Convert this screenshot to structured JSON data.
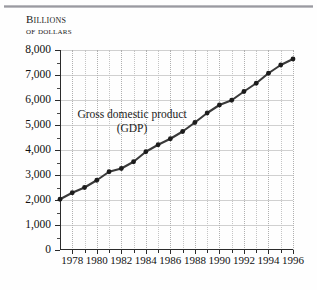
{
  "figure": {
    "background_color": "#fefefe",
    "rule_color": "#9a9aa0",
    "axis_color": "#2b2b2b",
    "series_color": "#3a3a3a",
    "marker_color": "#1c1c1c",
    "grid_color": "#d0d0d0"
  },
  "unit_caption": {
    "line1": "Billions",
    "line2": "of dollars"
  },
  "annotation": {
    "line1": "Gross domestic product",
    "line2": "(GDP)"
  },
  "chart_data": {
    "type": "line",
    "title": "",
    "subtitle": "",
    "xlabel": "",
    "ylabel": "Billions of dollars",
    "xlim": [
      1977,
      1996
    ],
    "ylim": [
      0,
      8000
    ],
    "ytick_values": [
      0,
      1000,
      2000,
      3000,
      4000,
      5000,
      6000,
      7000,
      8000
    ],
    "ytick_labels": [
      "0",
      "1,000",
      "2,000",
      "3,000",
      "4,000",
      "5,000",
      "6,000",
      "7,000",
      "8,000"
    ],
    "y_minor_ticks": [
      500,
      1500,
      2500,
      3500,
      4500,
      5500,
      6500,
      7500
    ],
    "xtick_values": [
      1978,
      1980,
      1982,
      1984,
      1986,
      1988,
      1990,
      1992,
      1994,
      1996
    ],
    "xtick_labels": [
      "1978",
      "1980",
      "1982",
      "1984",
      "1986",
      "1988",
      "1990",
      "1992",
      "1994",
      "1996"
    ],
    "x_minor_ticks": [
      1977,
      1979,
      1981,
      1983,
      1985,
      1987,
      1989,
      1991,
      1993,
      1995
    ],
    "grid": {
      "horizontal": true,
      "vertical": true,
      "vertical_style": "dotted"
    },
    "legend": {
      "visible": false,
      "position": "none"
    },
    "annotations": [
      {
        "text": "Gross domestic product (GDP)",
        "x": 1980.6,
        "y": 5250
      }
    ],
    "series": [
      {
        "name": "Gross domestic product (GDP)",
        "marker": "circle",
        "x": [
          1977,
          1978,
          1979,
          1980,
          1981,
          1982,
          1983,
          1984,
          1985,
          1986,
          1987,
          1988,
          1989,
          1990,
          1991,
          1992,
          1993,
          1994,
          1995,
          1996
        ],
        "values": [
          2030,
          2290,
          2500,
          2790,
          3130,
          3260,
          3530,
          3930,
          4210,
          4450,
          4740,
          5100,
          5480,
          5800,
          5990,
          6340,
          6670,
          7070,
          7400,
          7640
        ]
      }
    ]
  }
}
